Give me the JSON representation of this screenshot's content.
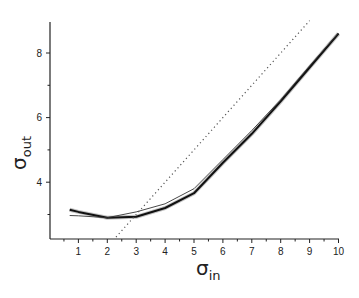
{
  "chart_data": {
    "type": "line",
    "title": "",
    "xlabel": "σ_in",
    "ylabel": "σ_out",
    "xlabel_main": "σ",
    "xlabel_sub": "in",
    "ylabel_main": "σ",
    "ylabel_sub": "out",
    "xlim": [
      0,
      10
    ],
    "ylim": [
      2.3,
      9.0
    ],
    "x_ticks": [
      1,
      2,
      3,
      4,
      5,
      6,
      7,
      8,
      9,
      10
    ],
    "y_ticks": [
      4,
      6,
      8
    ],
    "y_minor_ticks": [
      3,
      5,
      7
    ],
    "x_minor_ticks": [
      0.5,
      1.5,
      2.5,
      3.5,
      4.5,
      5.5,
      6.5,
      7.5,
      8.5,
      9.5
    ],
    "grid": false,
    "legend": null,
    "series": [
      {
        "name": "thick curve",
        "style": "solid-thick",
        "color": "#111111",
        "x": [
          0.7,
          1,
          2,
          3,
          4,
          5,
          6,
          7,
          8,
          9,
          10
        ],
        "y": [
          3.15,
          3.08,
          2.9,
          2.93,
          3.2,
          3.66,
          4.6,
          5.5,
          6.5,
          7.55,
          8.6
        ]
      },
      {
        "name": "thin curve",
        "style": "solid-thin",
        "color": "#333333",
        "x": [
          0.7,
          1,
          2,
          3,
          4,
          5,
          6,
          7,
          8,
          9,
          10
        ],
        "y": [
          2.97,
          2.96,
          2.9,
          3.08,
          3.33,
          3.8,
          4.7,
          5.6,
          6.55,
          7.6,
          8.62
        ]
      },
      {
        "name": "identity y = x",
        "style": "dotted",
        "color": "#555555",
        "x": [
          2.3,
          9.0
        ],
        "y": [
          2.3,
          9.0
        ]
      }
    ]
  }
}
